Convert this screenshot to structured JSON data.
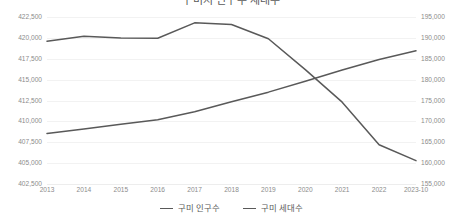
{
  "chart_data": {
    "type": "line",
    "title": "구미시 인구수 세대수",
    "xlabel": "",
    "ylabel": "구미 인구수",
    "y2label": "구미 세대수",
    "grid": true,
    "legend_position": "bottom",
    "categories": [
      "2013",
      "2014",
      "2015",
      "2016",
      "2017",
      "2018",
      "2019",
      "2020",
      "2021",
      "2022",
      "2023-10"
    ],
    "ylim": [
      402500,
      422500
    ],
    "y2lim": [
      155000,
      195000
    ],
    "ytick_labels": [
      "422,500",
      "420,000",
      "417,500",
      "415,000",
      "412,500",
      "410,000",
      "407,500",
      "405,000",
      "402,500"
    ],
    "ytick_values": [
      422500,
      420000,
      417500,
      415000,
      412500,
      410000,
      407500,
      405000,
      402500
    ],
    "y2tick_labels": [
      "195,000",
      "190,000",
      "185,000",
      "180,000",
      "175,000",
      "170,000",
      "165,000",
      "160,000",
      "155,000"
    ],
    "y2tick_values": [
      195000,
      190000,
      185000,
      180000,
      175000,
      170000,
      165000,
      160000,
      155000
    ],
    "series": [
      {
        "name": "구미 인구수",
        "axis": "left",
        "color": "#595959",
        "values": [
          419600,
          420200,
          420000,
          419950,
          421800,
          421600,
          419900,
          416200,
          412300,
          407200,
          405300
        ]
      },
      {
        "name": "구미 세대수",
        "axis": "right",
        "color": "#595959",
        "values": [
          167100,
          168200,
          169300,
          170400,
          172300,
          174700,
          177000,
          179600,
          182300,
          184800,
          186900
        ]
      }
    ]
  },
  "legend": {
    "items": [
      {
        "label": "구미 인구수"
      },
      {
        "label": "구미 세대수"
      }
    ]
  }
}
